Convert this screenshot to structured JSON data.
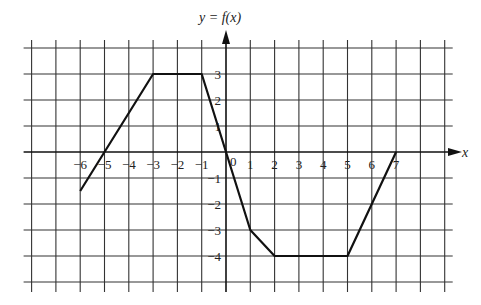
{
  "chart_data": {
    "type": "line",
    "title": "y = f(x)",
    "xlabel": "x",
    "ylabel": "y = f(x)",
    "origin_label": "0",
    "x_ticks": [
      -6,
      -5,
      -4,
      -3,
      -2,
      -1,
      1,
      2,
      3,
      4,
      5,
      6,
      7
    ],
    "y_ticks": [
      3,
      2,
      1,
      -1,
      -2,
      -3,
      -4
    ],
    "xlim": [
      -8,
      9
    ],
    "ylim": [
      -5,
      4
    ],
    "grid": true,
    "series": [
      {
        "name": "f(x)",
        "points": [
          [
            -6,
            -1.5
          ],
          [
            -3,
            3
          ],
          [
            -1,
            3
          ],
          [
            0,
            0
          ],
          [
            1,
            -3
          ],
          [
            2,
            -4
          ],
          [
            5,
            -4
          ],
          [
            7,
            0
          ]
        ]
      }
    ]
  },
  "labels": {
    "y_axis": "y = f(x)",
    "x_axis": "x",
    "origin": "0"
  }
}
